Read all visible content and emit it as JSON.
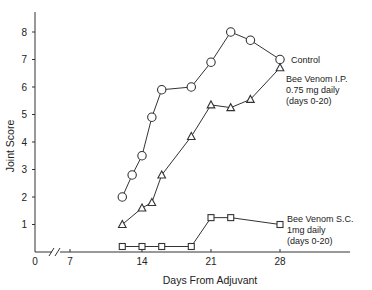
{
  "chart_data": {
    "type": "line",
    "title": "",
    "xlabel": "Days From Adjuvant",
    "ylabel": "Joint Score",
    "xticks": [
      0,
      7,
      14,
      21,
      28
    ],
    "yticks": [
      1,
      2,
      3,
      4,
      5,
      6,
      7,
      8
    ],
    "ylim": [
      0,
      8.6
    ],
    "xlim": [
      0,
      35
    ],
    "axis_break": "between 0 and 7 on x-axis",
    "grid": false,
    "legend_position": "inline annotations at right end of each series",
    "series": [
      {
        "name": "Control",
        "marker": "circle",
        "label_lines": [
          "Control"
        ],
        "x": [
          12,
          13,
          14,
          15,
          16,
          19,
          21,
          23,
          25,
          28
        ],
        "values": [
          2.0,
          2.8,
          3.5,
          4.9,
          5.9,
          6.0,
          6.9,
          8.0,
          7.7,
          7.0
        ]
      },
      {
        "name": "Bee Venom I.P. 0.75 mg daily (days 0-20)",
        "marker": "triangle",
        "label_lines": [
          "Bee Venom I.P.",
          "0.75 mg daily",
          "(days 0-20)"
        ],
        "x": [
          12,
          14,
          15,
          16,
          19,
          21,
          23,
          25,
          28
        ],
        "values": [
          1.0,
          1.6,
          1.8,
          2.8,
          4.2,
          5.35,
          5.25,
          5.55,
          6.7
        ]
      },
      {
        "name": "Bee Venom S.C. 1mg daily (days 0-20)",
        "marker": "square",
        "label_lines": [
          "Bee Venom S.C.",
          "1mg daily",
          "(days 0-20)"
        ],
        "x": [
          12,
          14,
          16,
          19,
          21,
          23,
          28
        ],
        "values": [
          0.2,
          0.2,
          0.2,
          0.2,
          1.25,
          1.25,
          1.0
        ]
      }
    ]
  }
}
